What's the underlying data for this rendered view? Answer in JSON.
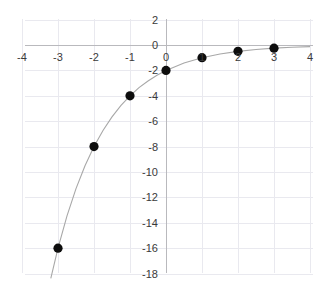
{
  "chart_data": {
    "type": "scatter",
    "title": "",
    "subtitle": "",
    "xlabel": "",
    "ylabel": "",
    "xlim": [
      -4,
      4
    ],
    "ylim": [
      -18,
      2
    ],
    "grid": true,
    "legend": null,
    "xticks": [
      -4,
      -3,
      -2,
      -1,
      0,
      1,
      2,
      3,
      4
    ],
    "xtick_labels": [
      "-4",
      "-3",
      "-2",
      "-1",
      "0",
      "1",
      "2",
      "3",
      "4"
    ],
    "yticks": [
      2,
      0,
      -2,
      -4,
      -6,
      -8,
      -10,
      -12,
      -14,
      -16,
      -18
    ],
    "ytick_labels": [
      "2",
      "0",
      "-2",
      "-4",
      "-6",
      "-8",
      "-10",
      "-12",
      "-14",
      "-16",
      "-18"
    ],
    "series": [
      {
        "name": "points",
        "kind": "scatter",
        "marker": "filled-circle",
        "color": "#0d0d0d",
        "x": [
          -3,
          -2,
          -1,
          0,
          1,
          2,
          3
        ],
        "y": [
          -16,
          -8,
          -4,
          -2,
          -1,
          -0.5,
          -0.25
        ]
      },
      {
        "name": "curve",
        "kind": "line",
        "color": "#a8a8a8",
        "equation": "y = -2 * (1/2)^x",
        "x": [
          -3.2,
          -3,
          -2.75,
          -2.5,
          -2.25,
          -2,
          -1.75,
          -1.5,
          -1.25,
          -1,
          -0.75,
          -0.5,
          -0.25,
          0,
          0.5,
          1,
          1.5,
          2,
          2.5,
          3,
          3.5,
          4
        ],
        "y": [
          -18.38,
          -16,
          -13.45,
          -11.31,
          -9.51,
          -8,
          -6.73,
          -5.66,
          -4.76,
          -4,
          -3.36,
          -2.83,
          -2.38,
          -2,
          -1.41,
          -1,
          -0.71,
          -0.5,
          -0.35,
          -0.25,
          -0.18,
          -0.125
        ]
      }
    ],
    "colors": {
      "grid": "#e9e9ef",
      "axis": "#b9b9bd",
      "curve": "#a8a8a8",
      "marker": "#0d0d0d",
      "tick_text": "#3a3a3a",
      "background": "#ffffff"
    },
    "geometry": {
      "x_origin_px": 166,
      "y_origin_px": 45,
      "px_per_x_unit": 36,
      "px_per_y_unit": 12.7,
      "plot_left_px": 25,
      "plot_right_px": 313,
      "plot_top_px": 19,
      "plot_bottom_px": 273
    }
  }
}
